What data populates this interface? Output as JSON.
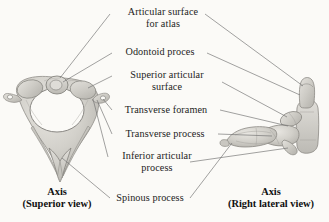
{
  "figure": {
    "background_color": "#fbfaf7",
    "ink_color": "#1d1d1d",
    "bone_fill": "#cfcdc8",
    "leader_line_color": "#6b6b6b"
  },
  "labels": [
    {
      "id": "articular-surface-for-atlas",
      "line1": "Articular surface",
      "line2": "for atlas"
    },
    {
      "id": "odontoid-process",
      "line1": "Odontoid proces",
      "line2": ""
    },
    {
      "id": "superior-articular-surface",
      "line1": "Superior articular",
      "line2": "surface"
    },
    {
      "id": "transverse-foramen",
      "line1": "Transverse foramen",
      "line2": ""
    },
    {
      "id": "transverse-process",
      "line1": "Transverse process",
      "line2": ""
    },
    {
      "id": "inferior-articular-process",
      "line1": "Inferior articular",
      "line2": "process"
    },
    {
      "id": "spinous-process",
      "line1": "Spinous process",
      "line2": ""
    }
  ],
  "captions": {
    "left": {
      "title": "Axis",
      "subtitle": "(Superior view)"
    },
    "right": {
      "title": "Axis",
      "subtitle": "(Right lateral view)"
    }
  },
  "views": {
    "superior": {
      "name": "Axis (Superior view)",
      "parts": [
        "vertebral foramen",
        "odontoid process",
        "superior articular surface",
        "transverse foramen",
        "transverse process",
        "bifid spinous process",
        "lamina",
        "pedicle"
      ]
    },
    "lateral": {
      "name": "Axis (Right lateral view)",
      "parts": [
        "vertebral body",
        "odontoid process",
        "articular surface for atlas",
        "transverse process",
        "inferior articular process",
        "spinous process"
      ]
    }
  }
}
